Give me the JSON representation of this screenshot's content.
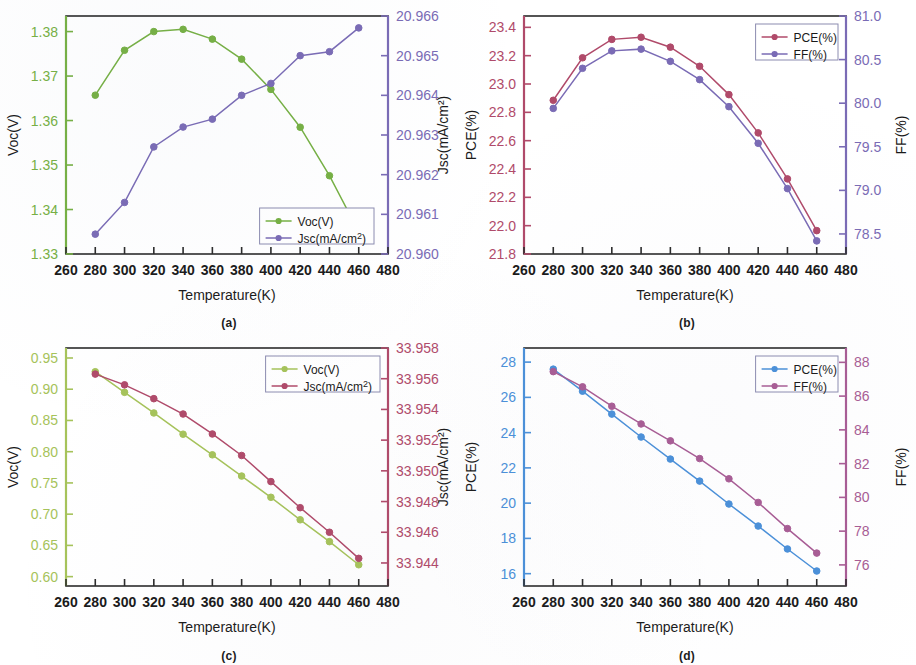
{
  "figure": {
    "panels": [
      {
        "id": "a",
        "caption": "(a)",
        "xlabel": "Temperature(K)",
        "left_axis_label": "Voc(V)",
        "right_axis_label": "Jsc(mA/cm²)",
        "legend": [
          "Voc(V)",
          "Jsc(mA/cm²)"
        ]
      },
      {
        "id": "b",
        "caption": "(b)",
        "xlabel": "Temperature(K)",
        "left_axis_label": "PCE(%)",
        "right_axis_label": "FF(%)",
        "legend": [
          "PCE(%)",
          "FF(%)"
        ]
      },
      {
        "id": "c",
        "caption": "(c)",
        "xlabel": "Temperature(K)",
        "left_axis_label": "Voc(V)",
        "right_axis_label": "Jsc(mA/cm²)",
        "legend": [
          "Voc(V)",
          "Jsc(mA/cm²)"
        ]
      },
      {
        "id": "d",
        "caption": "(d)",
        "xlabel": "Temperature(K)",
        "left_axis_label": "PCE(%)",
        "right_axis_label": "FF(%)",
        "legend": [
          "PCE(%)",
          "FF(%)"
        ]
      }
    ]
  },
  "colors": {
    "green": "#76b043",
    "purple": "#7a6bb5",
    "crimson": "#b04a6a",
    "blue": "#4a90d9",
    "mauve": "#a85c94",
    "axis": "#2b2b2b"
  },
  "chart_data": [
    {
      "type": "line",
      "panel": "a",
      "title": "(a)",
      "xlabel": "Temperature(K)",
      "x": [
        280,
        300,
        320,
        340,
        360,
        380,
        400,
        420,
        440,
        460
      ],
      "xlim": [
        260,
        480
      ],
      "xticks": [
        260,
        280,
        300,
        320,
        340,
        360,
        380,
        400,
        420,
        440,
        460,
        480
      ],
      "grid": false,
      "legend_position": "bottom-right",
      "axes": [
        {
          "side": "left",
          "label": "Voc(V)",
          "ylim": [
            1.33,
            1.3835
          ],
          "yticks": [
            1.33,
            1.34,
            1.35,
            1.36,
            1.37,
            1.38
          ],
          "color": "#76b043",
          "series": {
            "name": "Voc(V)",
            "marker": "circle",
            "values": [
              1.3657,
              1.3758,
              1.38,
              1.3805,
              1.3783,
              1.3738,
              1.367,
              1.3585,
              1.3476,
              1.335
            ]
          }
        },
        {
          "side": "right",
          "label": "Jsc(mA/cm²)",
          "ylim": [
            20.96,
            20.966
          ],
          "yticks": [
            20.96,
            20.961,
            20.962,
            20.963,
            20.964,
            20.965,
            20.966
          ],
          "color": "#7a6bb5",
          "series": {
            "name": "Jsc(mA/cm²)",
            "marker": "circle",
            "values": [
              20.9605,
              20.9613,
              20.9627,
              20.9632,
              20.9634,
              20.964,
              20.9643,
              20.965,
              20.9651,
              20.9657
            ]
          }
        }
      ]
    },
    {
      "type": "line",
      "panel": "b",
      "title": "(b)",
      "xlabel": "Temperature(K)",
      "x": [
        280,
        300,
        320,
        340,
        360,
        380,
        400,
        420,
        440,
        460
      ],
      "xlim": [
        260,
        480
      ],
      "xticks": [
        260,
        280,
        300,
        320,
        340,
        360,
        380,
        400,
        420,
        440,
        460,
        480
      ],
      "grid": false,
      "legend_position": "top-right",
      "axes": [
        {
          "side": "left",
          "label": "PCE(%)",
          "ylim": [
            21.8,
            23.48
          ],
          "yticks": [
            21.8,
            22.0,
            22.2,
            22.4,
            22.6,
            22.8,
            23.0,
            23.2,
            23.4
          ],
          "color": "#b04a6a",
          "series": {
            "name": "PCE(%)",
            "marker": "circle",
            "values": [
              22.885,
              23.185,
              23.315,
              23.33,
              23.26,
              23.125,
              22.925,
              22.655,
              22.33,
              21.965
            ]
          }
        },
        {
          "side": "right",
          "label": "FF(%)",
          "ylim": [
            78.27,
            81.0
          ],
          "yticks": [
            78.5,
            79.0,
            79.5,
            80.0,
            80.5,
            81.0
          ],
          "color": "#7a6bb5",
          "series": {
            "name": "FF(%)",
            "marker": "circle",
            "values": [
              79.94,
              80.4,
              80.6,
              80.62,
              80.48,
              80.27,
              79.96,
              79.54,
              79.02,
              78.42
            ]
          }
        }
      ]
    },
    {
      "type": "line",
      "panel": "c",
      "title": "(c)",
      "xlabel": "Temperature(K)",
      "x": [
        280,
        300,
        320,
        340,
        360,
        380,
        400,
        420,
        440,
        460
      ],
      "xlim": [
        260,
        480
      ],
      "xticks": [
        260,
        280,
        300,
        320,
        340,
        360,
        380,
        400,
        420,
        440,
        460,
        480
      ],
      "grid": false,
      "legend_position": "top-right",
      "axes": [
        {
          "side": "left",
          "label": "Voc(V)",
          "ylim": [
            0.585,
            0.966
          ],
          "yticks": [
            0.6,
            0.65,
            0.7,
            0.75,
            0.8,
            0.85,
            0.9,
            0.95
          ],
          "color": "#a6c35a",
          "series": {
            "name": "Voc(V)",
            "marker": "circle",
            "values": [
              0.928,
              0.895,
              0.862,
              0.828,
              0.795,
              0.761,
              0.727,
              0.691,
              0.656,
              0.619
            ]
          }
        },
        {
          "side": "right",
          "label": "Jsc(mA/cm²)",
          "ylim": [
            33.9425,
            33.958
          ],
          "yticks": [
            33.944,
            33.946,
            33.948,
            33.95,
            33.952,
            33.954,
            33.956,
            33.958
          ],
          "color": "#b04a6a",
          "series": {
            "name": "Jsc(mA/cm²)",
            "marker": "circle",
            "values": [
              33.9563,
              33.9556,
              33.9547,
              33.9537,
              33.9524,
              33.951,
              33.9493,
              33.9476,
              33.946,
              33.9443
            ]
          }
        }
      ]
    },
    {
      "type": "line",
      "panel": "d",
      "title": "(d)",
      "xlabel": "Temperature(K)",
      "x": [
        280,
        300,
        320,
        340,
        360,
        380,
        400,
        420,
        440,
        460
      ],
      "xlim": [
        260,
        480
      ],
      "xticks": [
        260,
        280,
        300,
        320,
        340,
        360,
        380,
        400,
        420,
        440,
        460,
        480
      ],
      "grid": false,
      "legend_position": "top-right",
      "axes": [
        {
          "side": "left",
          "label": "PCE(%)",
          "ylim": [
            15.3,
            28.8
          ],
          "yticks": [
            16,
            18,
            20,
            22,
            24,
            26,
            28
          ],
          "color": "#4a90d9",
          "series": {
            "name": "PCE(%)",
            "marker": "circle",
            "values": [
              27.6,
              26.35,
              25.05,
              23.75,
              22.5,
              21.25,
              19.95,
              18.7,
              17.4,
              16.15
            ]
          }
        },
        {
          "side": "right",
          "label": "FF(%)",
          "ylim": [
            74.75,
            88.85
          ],
          "yticks": [
            76,
            78,
            80,
            82,
            84,
            86,
            88
          ],
          "color": "#a85c94",
          "series": {
            "name": "FF(%)",
            "marker": "circle",
            "values": [
              87.45,
              86.55,
              85.4,
              84.35,
              83.35,
              82.3,
              81.1,
              79.7,
              78.15,
              76.7
            ]
          }
        }
      ]
    }
  ]
}
